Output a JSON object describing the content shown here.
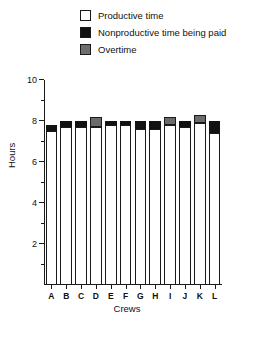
{
  "legend": {
    "items": [
      {
        "label": "Productive time",
        "swatch": "productive",
        "color": "#ffffff",
        "icon": "legend-swatch-icon"
      },
      {
        "label": "Nonproductive time being paid",
        "swatch": "nonproductive",
        "color": "#121212",
        "icon": "legend-swatch-icon"
      },
      {
        "label": "Overtime",
        "swatch": "overtime",
        "color": "#6b6b6b",
        "icon": "legend-swatch-icon"
      }
    ]
  },
  "chart_data": {
    "type": "bar",
    "title": "",
    "xlabel": "Crews",
    "ylabel": "Hours",
    "ylim": [
      0,
      10
    ],
    "yticks_major": [
      2,
      4,
      6,
      8,
      10
    ],
    "yticks_minor": [
      1,
      3,
      5,
      7,
      9
    ],
    "grid": false,
    "legend_position": "top",
    "stacked": true,
    "categories": [
      "A",
      "B",
      "C",
      "D",
      "E",
      "F",
      "G",
      "H",
      "I",
      "J",
      "K",
      "L"
    ],
    "series": [
      {
        "name": "Productive time",
        "color": "#ffffff",
        "values": [
          7.5,
          7.7,
          7.7,
          7.7,
          7.8,
          7.8,
          7.6,
          7.6,
          7.8,
          7.7,
          7.9,
          7.4
        ]
      },
      {
        "name": "Nonproductive time being paid",
        "color": "#121212",
        "values": [
          0.3,
          0.3,
          0.3,
          0.0,
          0.2,
          0.2,
          0.4,
          0.4,
          0.0,
          0.3,
          0.0,
          0.6
        ]
      },
      {
        "name": "Overtime",
        "color": "#6b6b6b",
        "values": [
          0.0,
          0.0,
          0.0,
          0.5,
          0.0,
          0.0,
          0.0,
          0.0,
          0.4,
          0.0,
          0.4,
          0.0
        ]
      }
    ],
    "totals": [
      7.8,
      8.0,
      8.0,
      8.2,
      8.0,
      8.0,
      8.0,
      8.0,
      8.2,
      8.0,
      8.3,
      8.0
    ]
  }
}
